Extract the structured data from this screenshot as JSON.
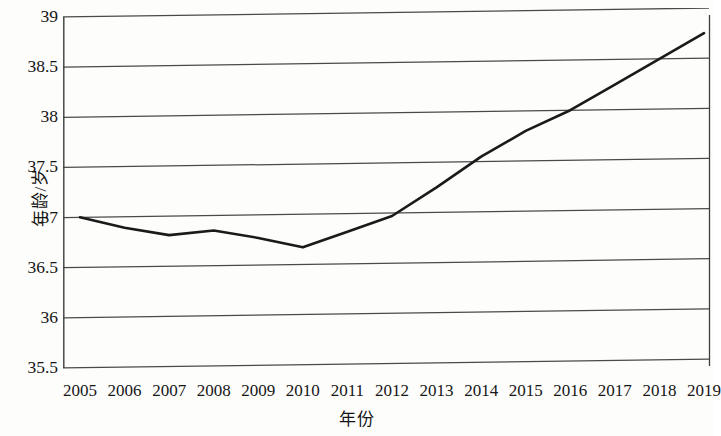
{
  "chart_data": {
    "type": "line",
    "title": "",
    "subtitle": "",
    "xlabel": "年份",
    "ylabel": "年龄/岁",
    "categories": [
      "2005",
      "2006",
      "2007",
      "2008",
      "2009",
      "2010",
      "2011",
      "2012",
      "2013",
      "2014",
      "2015",
      "2016",
      "2017",
      "2018",
      "2019"
    ],
    "values": [
      37.0,
      36.89,
      36.81,
      36.85,
      36.77,
      36.67,
      36.82,
      36.97,
      37.25,
      37.55,
      37.8,
      38.0,
      38.25,
      38.5,
      38.75
    ],
    "series": [
      {
        "name": "平均年龄",
        "values": [
          37.0,
          36.89,
          36.81,
          36.85,
          36.77,
          36.67,
          36.82,
          36.97,
          37.25,
          37.55,
          37.8,
          38.0,
          38.25,
          38.5,
          38.75
        ]
      }
    ],
    "ylim": [
      35.5,
      39
    ],
    "yticks": [
      35.5,
      36,
      36.5,
      37,
      37.5,
      38,
      38.5,
      39
    ],
    "ytick_labels": [
      "35.5",
      "36",
      "36.5",
      "37",
      "37.5",
      "38",
      "38.5",
      "39"
    ],
    "xlim": [
      "2005",
      "2019"
    ],
    "grid": "horizontal",
    "legend": "none",
    "line_color": "#1a1a1a",
    "grid_color": "#4a4a4a",
    "background_color": "#fdfdfc"
  },
  "axis": {
    "y_title": "年龄/岁",
    "x_title": "年份"
  }
}
